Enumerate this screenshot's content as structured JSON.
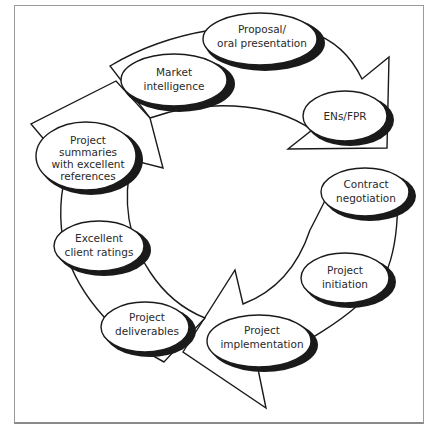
{
  "diagram": {
    "type": "cycle",
    "arrow_count": 3,
    "colors": {
      "stroke": "#1a1a1a",
      "fill": "#ffffff",
      "frame": "#9a9a9a",
      "text": "#2a2a2a"
    },
    "nodes": [
      {
        "id": "market",
        "lines": [
          "Market",
          "intelligence"
        ]
      },
      {
        "id": "proposal",
        "lines": [
          "Proposal/",
          "oral presentation"
        ]
      },
      {
        "id": "ens",
        "lines": [
          "ENs/FPR"
        ]
      },
      {
        "id": "contract",
        "lines": [
          "Contract",
          "negotiation"
        ]
      },
      {
        "id": "initiation",
        "lines": [
          "Project",
          "initiation"
        ]
      },
      {
        "id": "implementation",
        "lines": [
          "Project",
          "implementation"
        ]
      },
      {
        "id": "deliverables",
        "lines": [
          "Project",
          "deliverables"
        ]
      },
      {
        "id": "ratings",
        "lines": [
          "Excellent",
          "client ratings"
        ]
      },
      {
        "id": "summaries",
        "lines": [
          "Project",
          "summaries",
          "with excellent",
          "references"
        ]
      }
    ]
  }
}
